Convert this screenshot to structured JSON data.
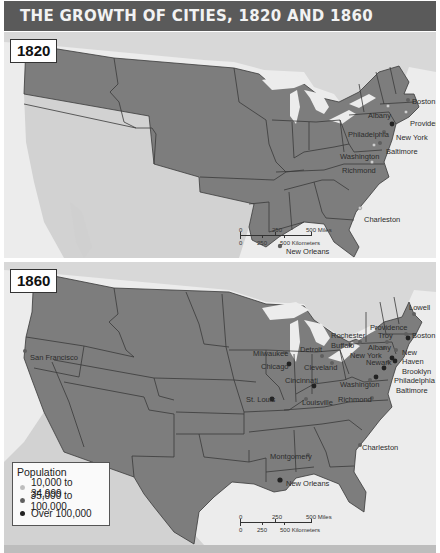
{
  "title": "THE GROWTH OF CITIES, 1820 AND 1860",
  "colors": {
    "title_bar": "#5a5a5a",
    "land_us": "#7d7d7d",
    "land_other": "#d6d6d6",
    "water": "#ececec",
    "border": "#3a3a3a",
    "small_city": "#cfcfcf",
    "medium_city": "#5f5f5f",
    "large_city": "#222222"
  },
  "maps": [
    {
      "year": "1820",
      "cities": [
        {
          "name": "Boston",
          "size": "medium"
        },
        {
          "name": "Albany",
          "size": "small"
        },
        {
          "name": "Providence",
          "size": "small"
        },
        {
          "name": "New York",
          "size": "large"
        },
        {
          "name": "Philadelphia",
          "size": "medium"
        },
        {
          "name": "Baltimore",
          "size": "medium"
        },
        {
          "name": "Washington",
          "size": "small"
        },
        {
          "name": "Richmond",
          "size": "small"
        },
        {
          "name": "Charleston",
          "size": "small"
        },
        {
          "name": "New Orleans",
          "size": "medium"
        }
      ],
      "scale": {
        "miles_ticks": [
          "0",
          "250",
          "500 Miles"
        ],
        "km_ticks": [
          "0",
          "250",
          "500 Kilometers"
        ]
      }
    },
    {
      "year": "1860",
      "cities": [
        {
          "name": "San Francisco",
          "size": "medium"
        },
        {
          "name": "Milwaukee",
          "size": "medium"
        },
        {
          "name": "Chicago",
          "size": "large"
        },
        {
          "name": "Detroit",
          "size": "medium"
        },
        {
          "name": "Cleveland",
          "size": "medium"
        },
        {
          "name": "Cincinnati",
          "size": "large"
        },
        {
          "name": "St. Louis",
          "size": "large"
        },
        {
          "name": "Louisville",
          "size": "medium"
        },
        {
          "name": "Rochester",
          "size": "medium"
        },
        {
          "name": "Buffalo",
          "size": "medium"
        },
        {
          "name": "Providence",
          "size": "medium"
        },
        {
          "name": "Troy",
          "size": "medium"
        },
        {
          "name": "Albany",
          "size": "medium"
        },
        {
          "name": "Lowell",
          "size": "medium"
        },
        {
          "name": "Boston",
          "size": "large"
        },
        {
          "name": "New York",
          "size": "large"
        },
        {
          "name": "Newark",
          "size": "medium"
        },
        {
          "name": "New Haven",
          "size": "medium"
        },
        {
          "name": "Brooklyn",
          "size": "large"
        },
        {
          "name": "Philadelphia",
          "size": "large"
        },
        {
          "name": "Baltimore",
          "size": "large"
        },
        {
          "name": "Washington",
          "size": "medium"
        },
        {
          "name": "Richmond",
          "size": "medium"
        },
        {
          "name": "Charleston",
          "size": "medium"
        },
        {
          "name": "Montgomery",
          "size": "small"
        },
        {
          "name": "New Orleans",
          "size": "large"
        }
      ],
      "scale": {
        "miles_ticks": [
          "0",
          "250",
          "500 Miles"
        ],
        "km_ticks": [
          "0",
          "250",
          "500 Kilometers"
        ]
      },
      "legend": {
        "title": "Population",
        "items": [
          {
            "label": "10,000 to 34,999",
            "size": "small"
          },
          {
            "label": "35,000 to 100,000",
            "size": "medium"
          },
          {
            "label": "Over 100,000",
            "size": "large"
          }
        ]
      }
    }
  ]
}
